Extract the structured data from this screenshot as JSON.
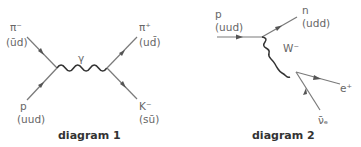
{
  "diagrams": [
    {
      "caption": "diagram 1",
      "particles": {
        "top_left": {
          "name": "π⁻",
          "quarks": "(ūd)"
        },
        "bottom_left": {
          "name": "p",
          "quarks": "(uud)"
        },
        "top_right": {
          "name": "π⁺",
          "quarks": "(ud̄)"
        },
        "bottom_right": {
          "name": "K⁻",
          "quarks": "(sū)"
        }
      },
      "exchange": {
        "name": "γ"
      }
    },
    {
      "caption": "diagram 2",
      "particles": {
        "incoming": {
          "name": "p",
          "quarks": "(uud)"
        },
        "outgoing_top": {
          "name": "n",
          "quarks": "(udd)"
        },
        "positron": {
          "name": "e⁺"
        },
        "antineutrino": {
          "name": "ν̄ₑ"
        }
      },
      "exchange": {
        "name": "W⁻"
      }
    }
  ],
  "colors": {
    "line": "#7a7a7a",
    "wave": "#333333",
    "label": "#666666",
    "caption": "#333333"
  }
}
